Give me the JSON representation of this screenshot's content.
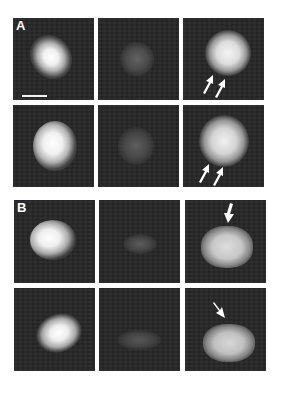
{
  "figure": {
    "panel_labels": {
      "A": "A",
      "B": "B"
    },
    "columns": 3,
    "rows_per_panel": 2,
    "scale_bar": {
      "present": true,
      "panel": "A-row1-col1"
    },
    "arrows": {
      "A_row1_col3": {
        "count": 2,
        "direction": "up-right"
      },
      "A_row2_col3": {
        "count": 2,
        "direction": "up-right"
      },
      "B_row1_col3": {
        "count": 1,
        "direction": "down"
      },
      "B_row2_col3": {
        "count": 1,
        "direction": "down-right"
      }
    },
    "colors": {
      "background": "#ffffff",
      "panel_bg": "#262626",
      "signal": "#f5f5f5",
      "dim_signal": "#5a5a5a"
    }
  }
}
